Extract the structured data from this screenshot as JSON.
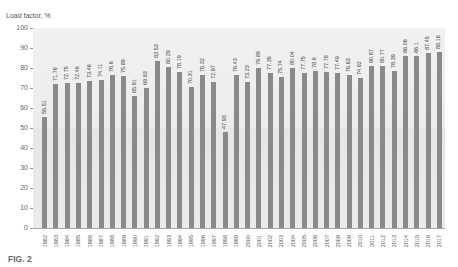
{
  "figure_label": "FIG. 2",
  "chart_data": {
    "type": "bar",
    "title": "",
    "xlabel": "",
    "ylabel": "Load factor, %",
    "ylim": [
      0,
      100
    ],
    "yticks": [
      0,
      10,
      20,
      30,
      40,
      50,
      60,
      70,
      80,
      90,
      100
    ],
    "grid": false,
    "legend": null,
    "bar_color": "#8a8a8a",
    "background_color": "#ebebeb",
    "categories": [
      "1982",
      "1983",
      "1984",
      "1985",
      "1986",
      "1987",
      "1988",
      "1989",
      "1990",
      "1991",
      "1992",
      "1993",
      "1994",
      "1995",
      "1996",
      "1997",
      "1998",
      "1999",
      "2000",
      "2001",
      "2002",
      "2003",
      "2004",
      "2005",
      "2006",
      "2007",
      "2008",
      "2009",
      "2010",
      "2011",
      "2012",
      "2013",
      "2014",
      "2015",
      "2016",
      "2017"
    ],
    "values": [
      55.51,
      71.76,
      72.75,
      72.46,
      73.46,
      74.11,
      76.6,
      75.89,
      65.91,
      69.83,
      83.53,
      80.29,
      78.19,
      70.31,
      76.32,
      72.97,
      47.93,
      76.43,
      73.23,
      79.89,
      77.35,
      75.74,
      80.04,
      77.75,
      78.6,
      77.78,
      77.49,
      76.63,
      74.82,
      80.87,
      80.77,
      78.39,
      86.06,
      86.1,
      87.45,
      88.16
    ],
    "value_labels": [
      "55.51",
      "71.76",
      "72.75",
      "72.46",
      "73.46",
      "74.11",
      "76.6",
      "75.89",
      "65.91",
      "69.83",
      "83.53",
      "80.29",
      "78.19",
      "70.31",
      "76.32",
      "72.97",
      "47.93",
      "76.43",
      "73.23",
      "79.89",
      "77.35",
      "75.74",
      "80.04",
      "77.75",
      "78.6",
      "77.78",
      "77.49",
      "76.63",
      "74.82",
      "80.87",
      "80.77",
      "78.39",
      "86.06",
      "86.1",
      "87.45",
      "88.16"
    ]
  }
}
